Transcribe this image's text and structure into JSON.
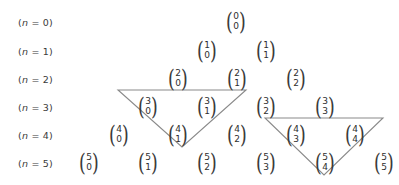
{
  "figure": {
    "width": 399,
    "height": 185,
    "background_color": "#ffffff",
    "line_color": "#8a8a8a",
    "text_color": "#2e2e2e"
  },
  "row_labels": [
    {
      "id": "n0",
      "text": "(n = 0)",
      "n": 0,
      "x": 18,
      "y": 22
    },
    {
      "id": "n1",
      "text": "(n = 1)",
      "n": 1,
      "x": 18,
      "y": 51
    },
    {
      "id": "n2",
      "text": "(n = 2)",
      "n": 2,
      "x": 18,
      "y": 79
    },
    {
      "id": "n3",
      "text": "(n = 3)",
      "n": 3,
      "x": 18,
      "y": 107
    },
    {
      "id": "n4",
      "text": "(n = 4)",
      "n": 4,
      "x": 18,
      "y": 135
    },
    {
      "id": "n5",
      "text": "(n = 5)",
      "n": 5,
      "x": 18,
      "y": 163
    }
  ],
  "coefficients": [
    {
      "id": "c-0-0",
      "n": "0",
      "k": "0",
      "x": 236,
      "y": 22
    },
    {
      "id": "c-1-0",
      "n": "1",
      "k": "0",
      "x": 207,
      "y": 51
    },
    {
      "id": "c-1-1",
      "n": "1",
      "k": "1",
      "x": 266,
      "y": 51
    },
    {
      "id": "c-2-0",
      "n": "2",
      "k": "0",
      "x": 178,
      "y": 79
    },
    {
      "id": "c-2-1",
      "n": "2",
      "k": "1",
      "x": 237,
      "y": 79
    },
    {
      "id": "c-2-2",
      "n": "2",
      "k": "2",
      "x": 296,
      "y": 79
    },
    {
      "id": "c-3-0",
      "n": "3",
      "k": "0",
      "x": 148,
      "y": 107
    },
    {
      "id": "c-3-1",
      "n": "3",
      "k": "1",
      "x": 207,
      "y": 107
    },
    {
      "id": "c-3-2",
      "n": "3",
      "k": "2",
      "x": 266,
      "y": 107
    },
    {
      "id": "c-3-3",
      "n": "3",
      "k": "3",
      "x": 325,
      "y": 107
    },
    {
      "id": "c-4-0",
      "n": "4",
      "k": "0",
      "x": 119,
      "y": 135
    },
    {
      "id": "c-4-1",
      "n": "4",
      "k": "1",
      "x": 178,
      "y": 135
    },
    {
      "id": "c-4-2",
      "n": "4",
      "k": "2",
      "x": 237,
      "y": 135
    },
    {
      "id": "c-4-3",
      "n": "4",
      "k": "3",
      "x": 296,
      "y": 135
    },
    {
      "id": "c-4-4",
      "n": "4",
      "k": "4",
      "x": 355,
      "y": 135
    },
    {
      "id": "c-5-0",
      "n": "5",
      "k": "0",
      "x": 89,
      "y": 163
    },
    {
      "id": "c-5-1",
      "n": "5",
      "k": "1",
      "x": 148,
      "y": 163
    },
    {
      "id": "c-5-2",
      "n": "5",
      "k": "2",
      "x": 207,
      "y": 163
    },
    {
      "id": "c-5-3",
      "n": "5",
      "k": "3",
      "x": 266,
      "y": 163
    },
    {
      "id": "c-5-4",
      "n": "5",
      "k": "4",
      "x": 325,
      "y": 163
    },
    {
      "id": "c-5-5",
      "n": "5",
      "k": "5",
      "x": 384,
      "y": 163
    }
  ],
  "triangles": [
    {
      "id": "triangle-left",
      "points": "118,90 246,90 182,147",
      "stroke": "#8a8a8a",
      "stroke_width": 1.1
    },
    {
      "id": "triangle-right",
      "points": "265,118 383,118 324,175",
      "stroke": "#8a8a8a",
      "stroke_width": 1.1
    }
  ]
}
